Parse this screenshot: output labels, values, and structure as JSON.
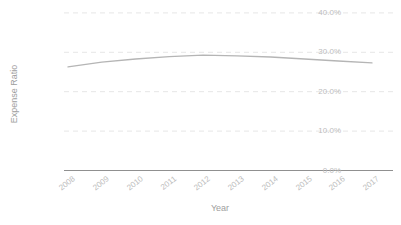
{
  "chart_data": {
    "type": "line",
    "title": "",
    "xlabel": "Year",
    "ylabel": "Expense Ratio",
    "x": [
      2008,
      2009,
      2010,
      2011,
      2012,
      2013,
      2014,
      2015,
      2016,
      2017
    ],
    "series": [
      {
        "name": "Expense Ratio",
        "values": [
          26.3,
          27.5,
          28.3,
          28.9,
          29.3,
          29.1,
          28.8,
          28.3,
          27.8,
          27.3
        ]
      }
    ],
    "ylim": [
      0,
      40
    ],
    "y_tick_step": 10,
    "y_tick_labels": [
      "0.0%",
      "10.0%",
      "20.0%",
      "30.0%",
      "40.0%"
    ],
    "x_tick_rotation_deg": 38,
    "grid": "horizontal-dashed",
    "legend": "none"
  },
  "colors": {
    "background": "#ffffff",
    "gridline": "#e6e6e6",
    "axis_line": "#909090",
    "data_line": "#b5b5b5",
    "tick_label": "#bdbdbd",
    "axis_title": "#9e9e9e"
  }
}
